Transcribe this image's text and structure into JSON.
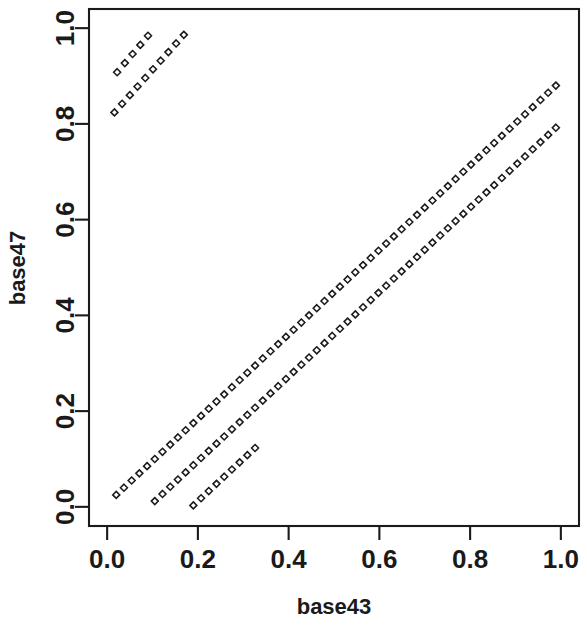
{
  "figure": {
    "background_color": "#ffffff",
    "foreground_color": "#1a1a1a",
    "width": 587,
    "height": 628
  },
  "axes": {
    "x_title": "base43",
    "y_title": "base47",
    "x_ticks": [
      "0.0",
      "0.2",
      "0.4",
      "0.6",
      "0.8",
      "1.0"
    ],
    "y_ticks": [
      "0.0",
      "0.2",
      "0.4",
      "0.6",
      "0.8",
      "1.0"
    ],
    "x_tick_values": [
      0.0,
      0.2,
      0.4,
      0.6,
      0.8,
      1.0
    ],
    "y_tick_values": [
      0.0,
      0.2,
      0.4,
      0.6,
      0.8,
      1.0
    ]
  },
  "chart_data": {
    "type": "scatter",
    "title": "",
    "xlabel": "base43",
    "ylabel": "base47",
    "xlim": [
      -0.04,
      1.04
    ],
    "ylim": [
      -0.04,
      1.04
    ],
    "grid": false,
    "legend": null,
    "marker": {
      "shape": "open-diamond",
      "size_px": 7,
      "color": "#1a1a1a",
      "filled": false
    },
    "series": [
      {
        "name": "band-a",
        "comment": "long lower-left to upper-right band",
        "x": [
          0.02,
          0.037,
          0.054,
          0.071,
          0.088,
          0.105,
          0.122,
          0.139,
          0.156,
          0.173,
          0.19,
          0.207,
          0.224,
          0.241,
          0.258,
          0.275,
          0.292,
          0.309,
          0.326,
          0.343,
          0.36,
          0.377,
          0.394,
          0.411,
          0.428,
          0.445,
          0.462,
          0.479,
          0.496,
          0.513,
          0.53,
          0.547,
          0.564,
          0.581,
          0.598,
          0.615,
          0.632,
          0.649,
          0.666,
          0.683,
          0.7,
          0.717,
          0.734,
          0.751,
          0.768,
          0.785,
          0.802,
          0.819,
          0.836,
          0.853,
          0.87,
          0.887,
          0.904,
          0.921,
          0.938,
          0.955,
          0.972,
          0.989
        ],
        "y": [
          0.025,
          0.04,
          0.055,
          0.07,
          0.085,
          0.1,
          0.115,
          0.13,
          0.145,
          0.16,
          0.175,
          0.19,
          0.205,
          0.22,
          0.235,
          0.25,
          0.265,
          0.28,
          0.295,
          0.31,
          0.325,
          0.34,
          0.355,
          0.37,
          0.385,
          0.4,
          0.415,
          0.43,
          0.445,
          0.46,
          0.475,
          0.49,
          0.505,
          0.52,
          0.535,
          0.55,
          0.565,
          0.58,
          0.595,
          0.61,
          0.625,
          0.64,
          0.655,
          0.67,
          0.685,
          0.7,
          0.715,
          0.73,
          0.745,
          0.76,
          0.775,
          0.79,
          0.805,
          0.82,
          0.835,
          0.85,
          0.865,
          0.88
        ]
      },
      {
        "name": "band-b",
        "comment": "second long band, offset right/below band-a",
        "x": [
          0.105,
          0.122,
          0.139,
          0.156,
          0.173,
          0.19,
          0.207,
          0.224,
          0.241,
          0.258,
          0.275,
          0.292,
          0.309,
          0.326,
          0.343,
          0.36,
          0.377,
          0.394,
          0.411,
          0.428,
          0.445,
          0.462,
          0.479,
          0.496,
          0.513,
          0.53,
          0.547,
          0.564,
          0.581,
          0.598,
          0.615,
          0.632,
          0.649,
          0.666,
          0.683,
          0.7,
          0.717,
          0.734,
          0.751,
          0.768,
          0.785,
          0.802,
          0.819,
          0.836,
          0.853,
          0.87,
          0.887,
          0.904,
          0.921,
          0.938,
          0.955,
          0.972,
          0.989
        ],
        "y": [
          0.012,
          0.027,
          0.042,
          0.057,
          0.072,
          0.087,
          0.102,
          0.117,
          0.132,
          0.147,
          0.162,
          0.177,
          0.192,
          0.207,
          0.222,
          0.237,
          0.252,
          0.267,
          0.282,
          0.297,
          0.312,
          0.327,
          0.342,
          0.357,
          0.372,
          0.387,
          0.402,
          0.417,
          0.432,
          0.447,
          0.462,
          0.477,
          0.492,
          0.507,
          0.522,
          0.537,
          0.552,
          0.567,
          0.582,
          0.597,
          0.612,
          0.627,
          0.642,
          0.657,
          0.672,
          0.687,
          0.702,
          0.717,
          0.732,
          0.747,
          0.762,
          0.777,
          0.792
        ]
      },
      {
        "name": "band-c",
        "comment": "short third band near the bottom-left",
        "x": [
          0.19,
          0.207,
          0.224,
          0.241,
          0.258,
          0.275,
          0.292,
          0.309,
          0.326
        ],
        "y": [
          0.003,
          0.018,
          0.033,
          0.048,
          0.063,
          0.078,
          0.093,
          0.108,
          0.123
        ]
      },
      {
        "name": "cluster-upper-segment",
        "comment": "upper-left detached cluster, upper short diagonal",
        "x": [
          0.022,
          0.039,
          0.056,
          0.073,
          0.09
        ],
        "y": [
          0.908,
          0.927,
          0.946,
          0.965,
          0.984
        ]
      },
      {
        "name": "cluster-lower-segment",
        "comment": "upper-left detached cluster, lower longer diagonal",
        "x": [
          0.016,
          0.033,
          0.05,
          0.067,
          0.084,
          0.101,
          0.118,
          0.135,
          0.152,
          0.169
        ],
        "y": [
          0.824,
          0.842,
          0.86,
          0.878,
          0.896,
          0.914,
          0.932,
          0.95,
          0.968,
          0.986
        ]
      }
    ]
  }
}
